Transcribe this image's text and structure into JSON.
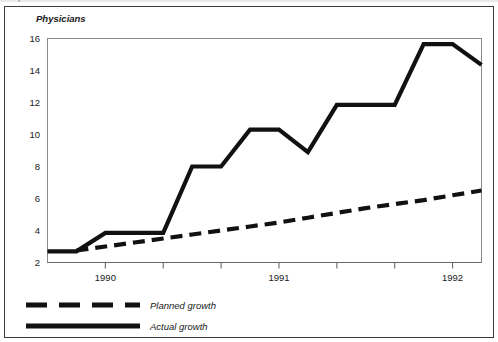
{
  "figure": {
    "background_color": "#ffffff",
    "frame_color": "#3a3a3a",
    "line_color": "#111111"
  },
  "chart_data": {
    "type": "line",
    "title": "",
    "subtitle": "",
    "ylabel": "Physicians",
    "xlabel": "",
    "ylim": [
      2,
      16
    ],
    "yticks": [
      2,
      4,
      6,
      8,
      10,
      12,
      14,
      16
    ],
    "ytick_labels": [
      "2",
      "4",
      "6",
      "8",
      "10",
      "12",
      "14",
      "16"
    ],
    "xlim": [
      0,
      15
    ],
    "xtick_positions": [
      2,
      4,
      6,
      8,
      10,
      12,
      14
    ],
    "xtick_labels": [
      "1990",
      "",
      "",
      "1991",
      "",
      "",
      "1992"
    ],
    "xtick_major_labels": [
      "1990",
      "1991",
      "1992"
    ],
    "grid": false,
    "legend_position": "below-plot-left",
    "series": [
      {
        "name": "Planned growth",
        "style": "dashed",
        "color": "#111111",
        "x": [
          1,
          2,
          3,
          4,
          5,
          6,
          7,
          8,
          9,
          10,
          11,
          12,
          13,
          14,
          15
        ],
        "values": [
          2.75,
          3.0,
          3.25,
          3.5,
          3.75,
          4.0,
          4.25,
          4.5,
          4.8,
          5.1,
          5.4,
          5.65,
          5.9,
          6.2,
          6.5
        ]
      },
      {
        "name": "Actual growth",
        "style": "solid",
        "color": "#111111",
        "x": [
          0,
          1,
          2,
          3,
          4,
          5,
          6,
          7,
          8,
          9,
          10,
          11,
          12,
          13,
          14,
          15
        ],
        "values": [
          2.7,
          2.7,
          3.85,
          3.85,
          3.85,
          8.0,
          8.0,
          10.3,
          10.3,
          8.9,
          11.85,
          11.85,
          11.85,
          15.65,
          15.65,
          14.35
        ]
      }
    ],
    "annotations": []
  },
  "legend": {
    "items": [
      {
        "label": "Planned growth",
        "style": "dashed"
      },
      {
        "label": "Actual growth",
        "style": "solid"
      }
    ]
  }
}
